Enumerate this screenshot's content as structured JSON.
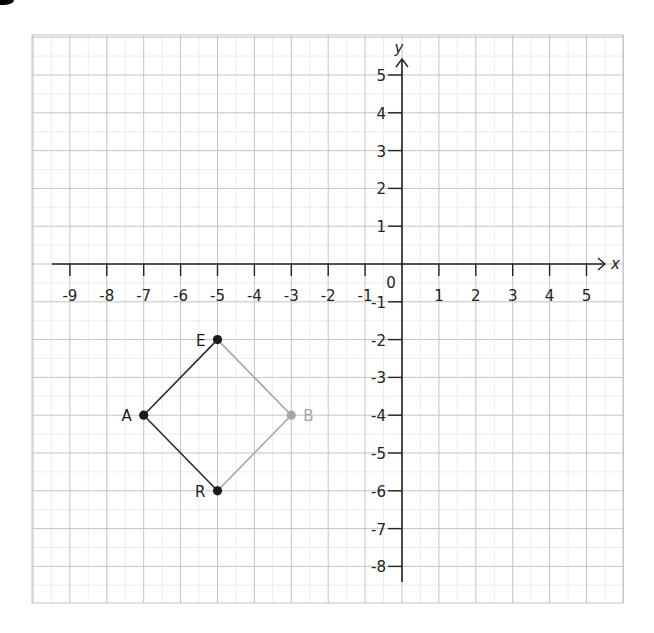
{
  "figure": {
    "x_axis_label": "x",
    "y_axis_label": "y",
    "origin_label": "0",
    "x_ticks": [
      "-9",
      "-8",
      "-7",
      "-6",
      "-5",
      "-4",
      "-3",
      "-2",
      "-1",
      "1",
      "2",
      "3",
      "4",
      "5"
    ],
    "y_ticks": [
      "5",
      "4",
      "3",
      "2",
      "1",
      "-1",
      "-2",
      "-3",
      "-4",
      "-5",
      "-6",
      "-7",
      "-8"
    ],
    "colors": {
      "background": "#ffffff",
      "grid_major": "#c4c4c4",
      "grid_minor": "#ececec",
      "axis": "#222222",
      "point_dark": "#1a1a1a",
      "point_light": "#a6a6a6",
      "edge_dark": "#2a2a2a",
      "edge_light": "#a6a6a6"
    }
  },
  "chart_data": {
    "type": "scatter",
    "title": "",
    "xlabel": "x",
    "ylabel": "y",
    "xlim": [
      -9,
      5
    ],
    "ylim": [
      -8,
      5
    ],
    "grid": true,
    "points": [
      {
        "label": "A",
        "x": -7,
        "y": -4,
        "color": "#1a1a1a"
      },
      {
        "label": "E",
        "x": -5,
        "y": -2,
        "color": "#1a1a1a"
      },
      {
        "label": "R",
        "x": -5,
        "y": -6,
        "color": "#1a1a1a"
      },
      {
        "label": "B",
        "x": -3,
        "y": -4,
        "color": "#a6a6a6"
      }
    ],
    "segments": [
      {
        "from": "E",
        "to": "A",
        "color": "#2a2a2a"
      },
      {
        "from": "A",
        "to": "R",
        "color": "#2a2a2a"
      },
      {
        "from": "E",
        "to": "B",
        "color": "#a6a6a6"
      },
      {
        "from": "R",
        "to": "B",
        "color": "#a6a6a6"
      }
    ]
  }
}
